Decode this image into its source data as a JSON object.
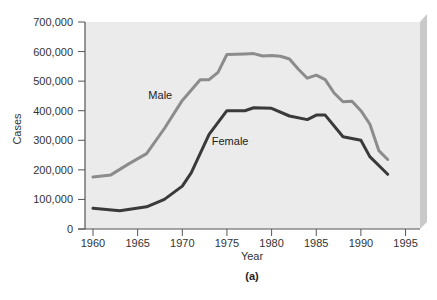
{
  "chart_data": {
    "type": "line",
    "title": "",
    "caption": "(a)",
    "xlabel": "Year",
    "ylabel": "Cases",
    "xlim": [
      1959,
      1997
    ],
    "ylim": [
      0,
      700000
    ],
    "grid": false,
    "legend": "inline labels",
    "x_ticks": [
      1960,
      1965,
      1970,
      1975,
      1980,
      1985,
      1990,
      1995
    ],
    "y_ticks": [
      0,
      100000,
      200000,
      300000,
      400000,
      500000,
      600000,
      700000
    ],
    "x_tick_labels": [
      "1960",
      "1965",
      "1970",
      "1975",
      "1980",
      "1985",
      "1990",
      "1995"
    ],
    "y_tick_labels": [
      "0",
      "100,000",
      "200,000",
      "300,000",
      "400,000",
      "500,000",
      "600,000",
      "700,000"
    ],
    "series": [
      {
        "name": "Male",
        "color": "#8c8c8c",
        "label_pos": {
          "x": 1966.2,
          "y": 440000
        },
        "x": [
          1960,
          1962,
          1964,
          1966,
          1968,
          1970,
          1972,
          1973,
          1974,
          1975,
          1977,
          1978,
          1979,
          1980,
          1981,
          1982,
          1983,
          1984,
          1985,
          1986,
          1987,
          1988,
          1989,
          1990,
          1991,
          1992,
          1993
        ],
        "values": [
          176000,
          183000,
          220000,
          255000,
          340000,
          435000,
          505000,
          505000,
          530000,
          590000,
          592000,
          593000,
          585000,
          587000,
          584000,
          575000,
          540000,
          510000,
          520000,
          505000,
          460000,
          430000,
          432000,
          400000,
          355000,
          265000,
          235000
        ]
      },
      {
        "name": "Female",
        "color": "#3a3a3a",
        "label_pos": {
          "x": 1973.3,
          "y": 285000
        },
        "x": [
          1960,
          1963,
          1966,
          1968,
          1970,
          1971,
          1973,
          1975,
          1977,
          1978,
          1980,
          1982,
          1984,
          1985,
          1986,
          1988,
          1990,
          1991,
          1993
        ],
        "values": [
          70000,
          62000,
          75000,
          100000,
          145000,
          190000,
          320000,
          400000,
          400000,
          410000,
          408000,
          382000,
          370000,
          385000,
          385000,
          312000,
          300000,
          245000,
          185000
        ]
      }
    ]
  },
  "colors": {
    "plot_background": "#ebebeb",
    "plot_side_shade": "#c9c9c9",
    "axis": "#555555"
  }
}
